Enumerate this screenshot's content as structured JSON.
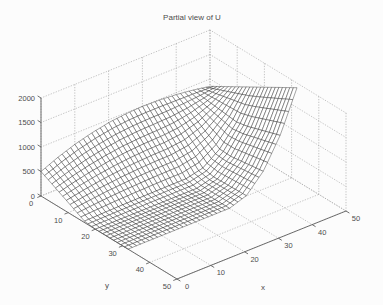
{
  "window": {
    "width": 383,
    "height": 305,
    "background": "#fcfcfc"
  },
  "chart_data": {
    "type": "surface",
    "title": "Partial view of U",
    "xlabel": "x",
    "ylabel": "y",
    "zlabel": "",
    "xlim": [
      0,
      50
    ],
    "ylim": [
      0,
      50
    ],
    "zlim": [
      0,
      2000
    ],
    "x_ticks": [
      0,
      10,
      20,
      30,
      40,
      50
    ],
    "y_ticks": [
      0,
      10,
      20,
      30,
      40,
      50
    ],
    "z_ticks": [
      0,
      500,
      1000,
      1500,
      2000
    ],
    "grid": true,
    "grid_style": "dotted",
    "view": {
      "azimuth": -37.5,
      "elevation": 30
    },
    "colors": {
      "face": "#ffffff",
      "edge": "#1a1a1a",
      "axis": "#606060",
      "grid": "#ababab",
      "text": "#4d4d4d"
    },
    "surface": {
      "x": [
        0,
        5,
        10,
        15,
        20,
        25,
        30,
        35,
        40,
        45,
        50
      ],
      "y": [
        0,
        4,
        8,
        12,
        16,
        20,
        24,
        28,
        32
      ],
      "z": [
        [
          500,
          650,
          775,
          870,
          940,
          980,
          995,
          986,
          959,
          913,
          850
        ],
        [
          382,
          497,
          593,
          665,
          719,
          749,
          761,
          775,
          816,
          885,
          982
        ],
        [
          265,
          344,
          410,
          461,
          498,
          519,
          527,
          564,
          674,
          857,
          1114
        ],
        [
          147,
          191,
          228,
          256,
          276,
          288,
          293,
          353,
          531,
          829,
          1246
        ],
        [
          29,
          38,
          46,
          51,
          55,
          58,
          59,
          141,
          389,
          801,
          1378
        ],
        [
          0,
          0,
          0,
          0,
          0,
          0,
          0,
          94,
          378,
          849,
          1510
        ],
        [
          0,
          0,
          0,
          0,
          0,
          0,
          0,
          103,
          411,
          924,
          1642
        ],
        [
          0,
          0,
          0,
          0,
          0,
          0,
          0,
          111,
          444,
          998,
          1774
        ],
        [
          0,
          0,
          0,
          0,
          0,
          0,
          0,
          119,
          477,
          1072,
          1906
        ]
      ]
    }
  }
}
